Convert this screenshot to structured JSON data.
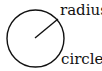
{
  "diagram": {
    "labels": {
      "radius": "radius",
      "circle": "circle"
    },
    "shapes": {
      "circle": {
        "cx": 35.5,
        "cy": 38.5,
        "r": 28.5,
        "stroke": "#111111",
        "stroke_width": 1.4
      },
      "radius_line": {
        "x1": 35,
        "y1": 38,
        "x2": 58,
        "y2": 19,
        "stroke": "#111111",
        "stroke_width": 1.4
      }
    }
  }
}
